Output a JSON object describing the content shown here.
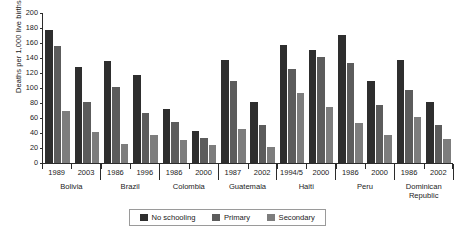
{
  "chart_data": {
    "type": "bar",
    "title": "",
    "xlabel": "",
    "ylabel": "Deaths per 1,000 live births",
    "ylim": [
      0,
      200
    ],
    "yticks": [
      0,
      20,
      40,
      60,
      80,
      100,
      120,
      140,
      160,
      180,
      200
    ],
    "ytick_labels": [
      "0",
      "20",
      "40",
      "60",
      "80",
      "100",
      "120",
      "140",
      "160",
      "180",
      "200"
    ],
    "grid": false,
    "legend_position": "bottom",
    "legend": [
      "No schooling",
      "Primary",
      "Secondary"
    ],
    "series": [
      {
        "name": "No schooling",
        "color": "#2e2e2e",
        "values": [
          177,
          128,
          136,
          118,
          72,
          43,
          138,
          82,
          158,
          151,
          171,
          109,
          138,
          81
        ]
      },
      {
        "name": "Primary",
        "color": "#5c5c5c",
        "values": [
          156,
          81,
          101,
          67,
          55,
          33,
          109,
          51,
          126,
          141,
          134,
          77,
          97,
          51
        ]
      },
      {
        "name": "Secondary",
        "color": "#7d7d7d",
        "values": [
          69,
          42,
          26,
          38,
          31,
          24,
          45,
          22,
          94,
          75,
          53,
          37,
          62,
          32
        ]
      }
    ],
    "categories": [
      "1989",
      "2003",
      "1986",
      "1996",
      "1986",
      "2000",
      "1987",
      "2002",
      "1994/5",
      "2000",
      "1986",
      "2000",
      "1986",
      "2002"
    ],
    "groups": [
      {
        "country": "Bolivia",
        "years": [
          "1989",
          "2003"
        ]
      },
      {
        "country": "Brazil",
        "years": [
          "1986",
          "1996"
        ]
      },
      {
        "country": "Colombia",
        "years": [
          "1986",
          "2000"
        ]
      },
      {
        "country": "Guatemala",
        "years": [
          "1987",
          "2002"
        ]
      },
      {
        "country": "Haiti",
        "years": [
          "1994/5",
          "2000"
        ]
      },
      {
        "country": "Peru",
        "years": [
          "1986",
          "2000"
        ]
      },
      {
        "country": "Dominican Republic",
        "years": [
          "1986",
          "2002"
        ]
      }
    ]
  },
  "axis": {
    "y_title": "Deaths per 1,000 live births"
  },
  "legend": {
    "items": [
      {
        "label": "No schooling",
        "color": "#2e2e2e"
      },
      {
        "label": "Primary",
        "color": "#5c5c5c"
      },
      {
        "label": "Secondary",
        "color": "#7d7d7d"
      }
    ]
  }
}
